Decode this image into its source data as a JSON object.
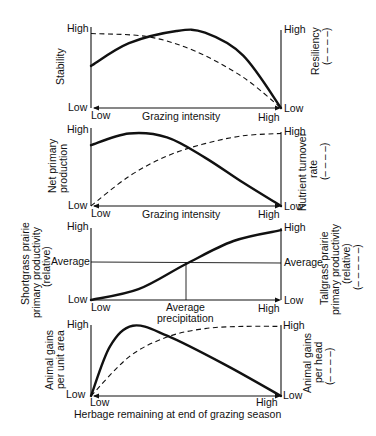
{
  "panels": [
    {
      "left_label": [
        "Stability"
      ],
      "right_label": [
        "Resiliency",
        "(– – – –)"
      ],
      "y_high": "High",
      "y_low": "Low",
      "x_low": "Low",
      "x_high": "High",
      "x_label": "Grazing intensity",
      "solid_curve": [
        [
          0,
          0.52
        ],
        [
          0.2,
          0.8
        ],
        [
          0.45,
          0.95
        ],
        [
          0.6,
          0.93
        ],
        [
          0.8,
          0.65
        ],
        [
          1,
          0
        ]
      ],
      "dashed_curve": [
        [
          0,
          0.92
        ],
        [
          0.3,
          0.88
        ],
        [
          0.55,
          0.7
        ],
        [
          0.8,
          0.38
        ],
        [
          1,
          0
        ]
      ]
    },
    {
      "left_label": [
        "Net primary",
        "production"
      ],
      "right_label": [
        "Nutrient turnover",
        "rate",
        "(– – – –)"
      ],
      "y_high": "High",
      "y_low": "Low",
      "x_low": "Low",
      "x_high": "High",
      "x_label": "Grazing intensity",
      "solid_curve": [
        [
          0,
          0.78
        ],
        [
          0.2,
          0.93
        ],
        [
          0.4,
          0.88
        ],
        [
          0.6,
          0.62
        ],
        [
          0.8,
          0.3
        ],
        [
          1,
          0
        ]
      ],
      "dashed_curve": [
        [
          0,
          0
        ],
        [
          0.2,
          0.38
        ],
        [
          0.4,
          0.64
        ],
        [
          0.6,
          0.8
        ],
        [
          0.8,
          0.9
        ],
        [
          1,
          0.93
        ]
      ]
    },
    {
      "left_label": [
        "Shortgrass prairie",
        "primary productivity",
        "(relative)"
      ],
      "right_label": [
        "Tallgrass prairie",
        "primary productivity",
        "(relative)",
        "(– – – – –)"
      ],
      "y_high": "High",
      "y_avg": "Average",
      "y_low": "Low",
      "x_low": "Low",
      "x_avg": "Average",
      "x_high": "High",
      "x_label": "precipitation",
      "solid_curve": [
        [
          0,
          0
        ],
        [
          0.25,
          0.15
        ],
        [
          0.5,
          0.5
        ],
        [
          0.75,
          0.82
        ],
        [
          1,
          0.97
        ]
      ]
    },
    {
      "left_label": [
        "Animal gains",
        "per unit area"
      ],
      "right_label": [
        "Animal gains",
        "per head",
        "(– – – –)"
      ],
      "y_high": "High",
      "y_low": "Low",
      "x_low": "Low",
      "x_high": "High",
      "x_label": "Herbage remaining at end of grazing season",
      "solid_curve": [
        [
          0,
          0
        ],
        [
          0.1,
          0.7
        ],
        [
          0.22,
          0.99
        ],
        [
          0.4,
          0.85
        ],
        [
          0.7,
          0.45
        ],
        [
          1,
          0
        ]
      ],
      "dashed_curve": [
        [
          0,
          0
        ],
        [
          0.2,
          0.55
        ],
        [
          0.4,
          0.83
        ],
        [
          0.6,
          0.95
        ],
        [
          0.8,
          0.98
        ],
        [
          1,
          0.98
        ]
      ]
    }
  ]
}
